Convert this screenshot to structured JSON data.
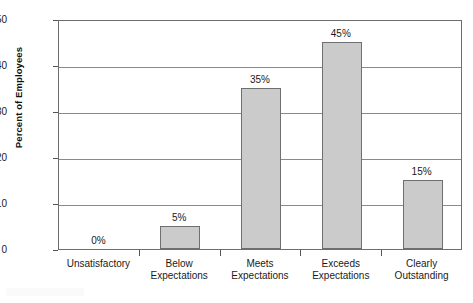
{
  "chart_data": {
    "type": "bar",
    "title": "",
    "xlabel": "",
    "ylabel": "Percent of Employees",
    "categories": [
      "Unsatisfactory",
      "Below\nExpectations",
      "Meets\nExpectations",
      "Exceeds\nExpectations",
      "Clearly\nOutstanding"
    ],
    "values": [
      0,
      5,
      35,
      45,
      15
    ],
    "data_labels": [
      "0%",
      "5%",
      "35%",
      "45%",
      "15%"
    ],
    "ylim": [
      0,
      50
    ],
    "yticks": [
      0,
      10,
      20,
      30,
      40,
      50
    ],
    "ytick_labels": [
      "0",
      "10",
      "20",
      "30",
      "40",
      "50"
    ],
    "grid": "horizontal",
    "legend": "none",
    "bar_fill": "#cbcbcb",
    "bar_border": "#6f6f6f",
    "axis_color": "#6e6e6e"
  },
  "watermark": {
    "text": ""
  }
}
